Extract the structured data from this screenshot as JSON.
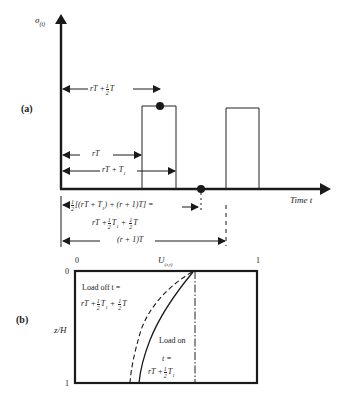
{
  "figure": {
    "panel_a": {
      "label": "(a)",
      "y_axis_label": "σ(t)",
      "x_axis_label": "Time t",
      "dimensions": [
        {
          "id": "rT_half_T",
          "text_main": "rT +",
          "frac": "1/2",
          "text_tail": "T"
        },
        {
          "id": "rT",
          "text_main": "rT"
        },
        {
          "id": "rT_T1",
          "text_main": "rT + T1"
        },
        {
          "id": "mid_expr",
          "line1_prefix": "1/2",
          "line1": "[(rT + T1) + (r + 1)T] =",
          "line2": "rT + 1/2 T1 + 1/2 T"
        },
        {
          "id": "r1T",
          "text_main": "(r + 1)T"
        }
      ],
      "pulses": [
        {
          "start": "rT",
          "end": "rT + T1",
          "marker": "midpoint of top (rT + 1/2 T)"
        },
        {
          "start": "(r+1)T",
          "end": "(r+1)T + T1"
        }
      ],
      "markers": [
        "dot at pulse top midpoint",
        "dot on time axis at rT + 1/2 T1 + 1/2 T"
      ]
    },
    "panel_b": {
      "label": "(b)",
      "x_axis_label": "U(z,t)",
      "y_axis_label": "z/H",
      "x_ticks": [
        "0",
        "1"
      ],
      "y_ticks": [
        "0",
        "1"
      ],
      "curve_dashed_label_line1": "Load off t =",
      "curve_dashed_label_line2": "rT + 1/2 T1 + 1/2 T",
      "curve_solid_label_line1": "Load on",
      "curve_solid_label_line2": "t =",
      "curve_solid_label_line3": "rT + 1/2 T1"
    }
  },
  "text": {
    "a_label": "(a)",
    "b_label": "(b)",
    "sigma": "σ",
    "sigma_sub": "(t)",
    "time": "Time t",
    "rT": "rT",
    "plus": "+",
    "T": "T",
    "T1": "T",
    "sub1": "1",
    "rT_plus": "rT +",
    "one": "1",
    "two": "2",
    "rT_T1": "rT + T",
    "bracket_expr": "[(rT + T",
    "bracket_expr2": ") + (r + 1)T] =",
    "r1T": "(r + 1)T",
    "U": "U",
    "U_sub": "(z,t)",
    "zH": "z/H",
    "zero": "0",
    "load_off": "Load off t =",
    "load_on": "Load on",
    "t_eq": "t =",
    "dash_tail": "T"
  }
}
